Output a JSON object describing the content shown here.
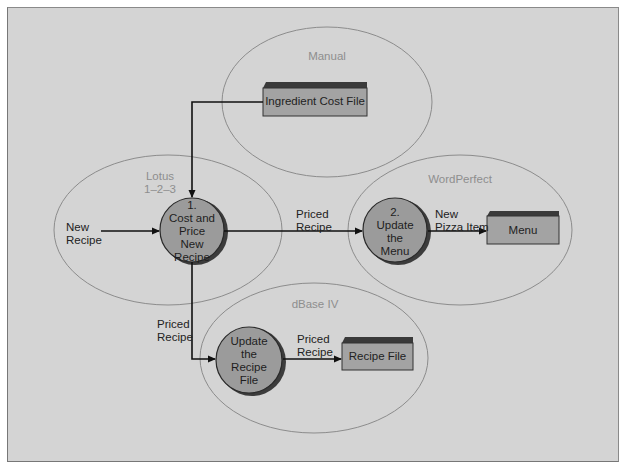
{
  "groups": {
    "manual": "Manual",
    "lotus_l1": "Lotus",
    "lotus_l2": "1–2–3",
    "wordperfect": "WordPerfect",
    "dbase": "dBase IV"
  },
  "processes": [
    {
      "number": "1.",
      "lines": [
        "Cost and",
        "Price",
        "New",
        "Recipe"
      ]
    },
    {
      "number": "2.",
      "lines": [
        "Update",
        "the",
        "Menu"
      ]
    },
    {
      "number": "",
      "lines": [
        "Update",
        "the",
        "Recipe",
        "File"
      ]
    }
  ],
  "stores": {
    "ingredient_cost_file": "Ingredient Cost File",
    "menu": "Menu",
    "recipe_file": "Recipe File"
  },
  "flows": {
    "new_recipe": [
      "New",
      "Recipe"
    ],
    "priced_recipe_to_menu": [
      "Priced",
      "Recipe"
    ],
    "new_pizza_item": [
      "New",
      "Pizza Item"
    ],
    "priced_recipe_down": [
      "Priced",
      "Recipe"
    ],
    "priced_recipe_to_file": [
      "Priced",
      "Recipe"
    ]
  },
  "colors": {
    "background": "#d4d4d4",
    "ellipse_stroke": "#8c8c8c",
    "process_fill": "#9b9b9b",
    "store_fill": "#a3a3a3",
    "store_top": "#3a3a3a",
    "arrow": "#111111"
  }
}
